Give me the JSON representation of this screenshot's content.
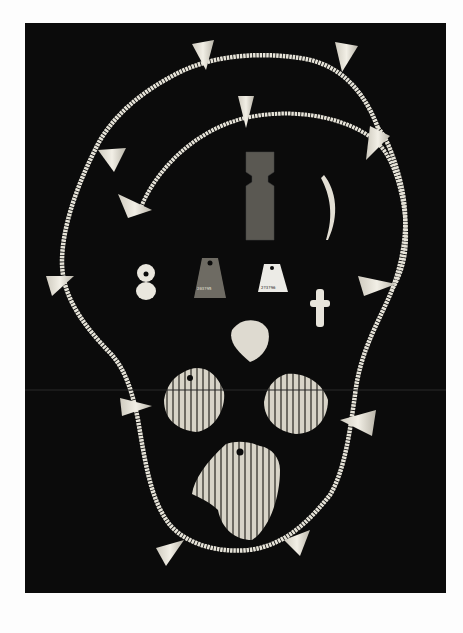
{
  "image": {
    "subject": "Archival photograph of shell and bone ornaments arranged on a dark background",
    "background_color": "#0b0b0b",
    "page_color": "#fdfdfd",
    "bead_color": "#e6e3d8",
    "catalog_labels": [
      "203?95",
      "2?3?96"
    ]
  },
  "objects": {
    "outer_necklace": "Long strand of disc beads with cone-shaped shell pendants",
    "inner_strand": "Shorter arc of disc beads with cone pendants",
    "stone_pendant": "Dark rectangular stone pendant with notched neck",
    "tooth": "Curved tooth/claw pendant",
    "figure_eight_bead": "White figure-eight bead",
    "dark_tablet_pendant": "Dark perforated tablet with catalog number",
    "light_tablet_pendant": "Light perforated tablet with catalog number",
    "cross_figure": "Small white cruciform figurine",
    "triangular_shell": "Rounded triangular shell",
    "scallop_shells": [
      "Left scallop shell (perforated)",
      "Right scallop shell",
      "Lower broken scallop shell (perforated)"
    ]
  }
}
